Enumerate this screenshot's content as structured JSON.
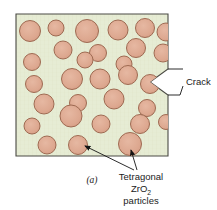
{
  "figure": {
    "caption": "(a)",
    "colors": {
      "matrix_fill": "#e6ecd4",
      "matrix_texture": "#dbe4c4",
      "particle_fill": "#dda890",
      "particle_stroke": "#9e6a52",
      "frame_stroke": "#4a4a44",
      "leader_stroke": "#141414",
      "text": "#1b1b1b",
      "page_background": "#ffffff"
    },
    "frame": {
      "x": 16,
      "y": 14,
      "width": 152,
      "height": 142
    }
  },
  "annotations": {
    "crack": {
      "label": "Crack",
      "notch_apex_x": 168,
      "notch_apex_y": 82,
      "notch_depth": 18,
      "notch_half_height": 13
    },
    "particles_label": {
      "line1": "Tetragonal",
      "line2_main": "ZrO",
      "line2_sub": "2",
      "line3": "particles"
    }
  },
  "chart_data": {
    "type": "scatter",
    "xlabel": "",
    "ylabel": "",
    "xlim": [
      16,
      168
    ],
    "ylim": [
      14,
      156
    ],
    "grid": false,
    "legend": "none",
    "particles": [
      {
        "cx": 30,
        "cy": 31,
        "r": 10.5
      },
      {
        "cx": 56,
        "cy": 28,
        "r": 8.0
      },
      {
        "cx": 87,
        "cy": 31,
        "r": 11.5
      },
      {
        "cx": 118,
        "cy": 30,
        "r": 10.0
      },
      {
        "cx": 145,
        "cy": 28,
        "r": 9.5
      },
      {
        "cx": 166,
        "cy": 32,
        "r": 9.0
      },
      {
        "cx": 63,
        "cy": 50,
        "r": 9.0
      },
      {
        "cx": 98,
        "cy": 53,
        "r": 8.5
      },
      {
        "cx": 136,
        "cy": 48,
        "r": 9.5
      },
      {
        "cx": 163,
        "cy": 53,
        "r": 9.0
      },
      {
        "cx": 32,
        "cy": 62,
        "r": 8.5
      },
      {
        "cx": 85,
        "cy": 60,
        "r": 8.0
      },
      {
        "cx": 124,
        "cy": 64,
        "r": 8.0
      },
      {
        "cx": 34,
        "cy": 84,
        "r": 8.5
      },
      {
        "cx": 72,
        "cy": 79,
        "r": 10.5
      },
      {
        "cx": 100,
        "cy": 79,
        "r": 10.0
      },
      {
        "cx": 128,
        "cy": 75,
        "r": 9.5
      },
      {
        "cx": 150,
        "cy": 84,
        "r": 9.5
      },
      {
        "cx": 44,
        "cy": 104,
        "r": 10.0
      },
      {
        "cx": 78,
        "cy": 103,
        "r": 8.5
      },
      {
        "cx": 114,
        "cy": 99,
        "r": 10.0
      },
      {
        "cx": 147,
        "cy": 108,
        "r": 8.5
      },
      {
        "cx": 71,
        "cy": 116,
        "r": 11.0
      },
      {
        "cx": 32,
        "cy": 126,
        "r": 8.0
      },
      {
        "cx": 101,
        "cy": 124,
        "r": 9.0
      },
      {
        "cx": 140,
        "cy": 124,
        "r": 9.5
      },
      {
        "cx": 166,
        "cy": 122,
        "r": 7.5
      },
      {
        "cx": 47,
        "cy": 145,
        "r": 9.0
      },
      {
        "cx": 78,
        "cy": 145,
        "r": 9.5
      },
      {
        "cx": 130,
        "cy": 144,
        "r": 11.5
      }
    ]
  }
}
